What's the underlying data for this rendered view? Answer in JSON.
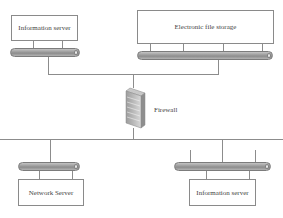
{
  "diagram": {
    "nodes": {
      "info_server_top": {
        "label": "Information server"
      },
      "file_storage": {
        "label": "Electronic file storage"
      },
      "firewall": {
        "label": "Firewall",
        "icon": "firewall-icon"
      },
      "network_server": {
        "label": "Network Server"
      },
      "info_server_bottom": {
        "label": "Information server"
      }
    },
    "edges": [
      {
        "from": "info_server_top",
        "to": "firewall"
      },
      {
        "from": "file_storage",
        "to": "firewall"
      },
      {
        "from": "firewall",
        "to": "network_server"
      },
      {
        "from": "firewall",
        "to": "info_server_bottom"
      }
    ]
  }
}
